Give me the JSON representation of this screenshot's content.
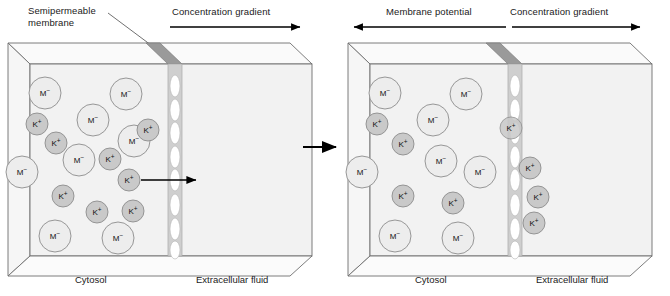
{
  "diagram": {
    "title_absent": true,
    "panels": [
      {
        "id": "before",
        "top_labels": {
          "membrane_label": "Semipermeable\nmembrane",
          "gradient_label": "Concentration gradient",
          "gradient_direction": "right"
        },
        "bottom_labels": {
          "left": "Cytosol",
          "right": "Extracellular fluid"
        },
        "ion_counts": {
          "M_minus_inside": 7,
          "K_plus_inside": 7,
          "K_plus_outside": 0
        },
        "ions_inside": [
          {
            "type": "M-",
            "label": "M",
            "charge": "−",
            "x": 45,
            "y": 93,
            "r": 16
          },
          {
            "type": "M-",
            "label": "M",
            "charge": "−",
            "x": 126,
            "y": 94,
            "r": 16
          },
          {
            "type": "M-",
            "label": "M",
            "charge": "−",
            "x": 93,
            "y": 120,
            "r": 16
          },
          {
            "type": "M-",
            "label": "M",
            "charge": "−",
            "x": 134,
            "y": 141,
            "r": 16
          },
          {
            "type": "M-",
            "label": "M",
            "charge": "−",
            "x": 79,
            "y": 160,
            "r": 16
          },
          {
            "type": "M-",
            "label": "M",
            "charge": "−",
            "x": 22,
            "y": 172,
            "r": 16
          },
          {
            "type": "M-",
            "label": "M",
            "charge": "−",
            "x": 55,
            "y": 236,
            "r": 16
          },
          {
            "type": "M-",
            "label": "M",
            "charge": "−",
            "x": 118,
            "y": 238,
            "r": 16
          },
          {
            "type": "K+",
            "label": "K",
            "charge": "+",
            "x": 37,
            "y": 124,
            "r": 11
          },
          {
            "type": "K+",
            "label": "K",
            "charge": "+",
            "x": 56,
            "y": 143,
            "r": 11
          },
          {
            "type": "K+",
            "label": "K",
            "charge": "+",
            "x": 148,
            "y": 130,
            "r": 11
          },
          {
            "type": "K+",
            "label": "K",
            "charge": "+",
            "x": 110,
            "y": 159,
            "r": 11
          },
          {
            "type": "K+",
            "label": "K",
            "charge": "+",
            "x": 129,
            "y": 180,
            "r": 11
          },
          {
            "type": "K+",
            "label": "K",
            "charge": "+",
            "x": 63,
            "y": 196,
            "r": 11
          },
          {
            "type": "K+",
            "label": "K",
            "charge": "+",
            "x": 97,
            "y": 212,
            "r": 11
          },
          {
            "type": "K+",
            "label": "K",
            "charge": "+",
            "x": 133,
            "y": 211,
            "r": 11
          }
        ],
        "ions_outside": [],
        "flux_arrow": {
          "present": true,
          "x1": 141,
          "y1": 180,
          "x2": 196,
          "y2": 180,
          "direction": "right"
        }
      },
      {
        "id": "after",
        "top_labels": {
          "potential_label": "Membrane potential",
          "potential_direction": "left",
          "gradient_label": "Concentration gradient",
          "gradient_direction": "right"
        },
        "bottom_labels": {
          "left": "Cytosol",
          "right": "Extracellular fluid"
        },
        "ion_counts": {
          "M_minus_inside": 8,
          "K_plus_inside": 5,
          "K_plus_outside": 3
        },
        "ions_inside": [
          {
            "type": "M-",
            "label": "M",
            "charge": "−",
            "x": 45,
            "y": 93,
            "r": 16
          },
          {
            "type": "M-",
            "label": "M",
            "charge": "−",
            "x": 126,
            "y": 94,
            "r": 16
          },
          {
            "type": "M-",
            "label": "M",
            "charge": "−",
            "x": 93,
            "y": 120,
            "r": 16
          },
          {
            "type": "M-",
            "label": "M",
            "charge": "−",
            "x": 101,
            "y": 161,
            "r": 16
          },
          {
            "type": "M-",
            "label": "M",
            "charge": "−",
            "x": 140,
            "y": 172,
            "r": 16
          },
          {
            "type": "M-",
            "label": "M",
            "charge": "−",
            "x": 22,
            "y": 172,
            "r": 16
          },
          {
            "type": "M-",
            "label": "M",
            "charge": "−",
            "x": 55,
            "y": 236,
            "r": 16
          },
          {
            "type": "M-",
            "label": "M",
            "charge": "−",
            "x": 118,
            "y": 238,
            "r": 16
          },
          {
            "type": "K+",
            "label": "K",
            "charge": "+",
            "x": 37,
            "y": 124,
            "r": 11
          },
          {
            "type": "K+",
            "label": "K",
            "charge": "+",
            "x": 63,
            "y": 144,
            "r": 11
          },
          {
            "type": "K+",
            "label": "K",
            "charge": "+",
            "x": 63,
            "y": 196,
            "r": 11
          },
          {
            "type": "K+",
            "label": "K",
            "charge": "+",
            "x": 113,
            "y": 203,
            "r": 11
          },
          {
            "type": "K+",
            "label": "K",
            "charge": "+",
            "x": 171,
            "y": 128,
            "r": 11
          }
        ],
        "ions_outside": [
          {
            "type": "K+",
            "label": "K",
            "charge": "+",
            "x": 190,
            "y": 168,
            "r": 11
          },
          {
            "type": "K+",
            "label": "K",
            "charge": "+",
            "x": 198,
            "y": 197,
            "r": 11
          },
          {
            "type": "K+",
            "label": "K",
            "charge": "+",
            "x": 194,
            "y": 223,
            "r": 11
          }
        ],
        "flux_arrow": {
          "present": false
        }
      }
    ],
    "transition_arrow": {
      "direction": "right",
      "label": ""
    },
    "membrane": {
      "pore_count": 8,
      "description": "vertical semipermeable membrane plate with elliptical pores"
    },
    "colors": {
      "m_ion_fill": "#ededed",
      "m_ion_stroke": "#8c8c8c",
      "k_ion_fill": "#c9c9c9",
      "k_ion_stroke": "#8c8c8c",
      "membrane_face": "#cfcfcf",
      "membrane_top": "#9a9a9a",
      "box_stroke": "#6e6e6e",
      "box_fill": "#f2f2f2",
      "pore_fill": "#ffffff",
      "text": "#1a1a1a",
      "arrow": "#000000"
    }
  }
}
